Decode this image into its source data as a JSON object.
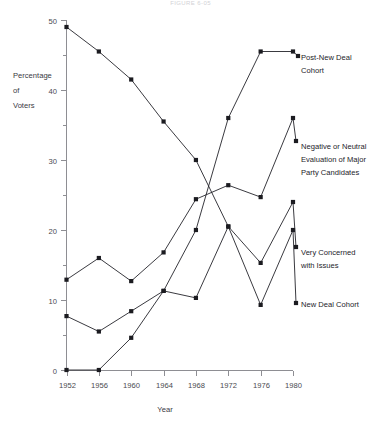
{
  "figure": {
    "title": "FIGURE 6-05",
    "axis_label_y_lines": [
      "Percentage",
      "of",
      "Voters"
    ],
    "axis_label_x": "Year"
  },
  "chart_data": {
    "type": "line",
    "title": "FIGURE 6-05",
    "xlabel": "Year",
    "ylabel": "Percentage of Voters",
    "categories": [
      "1952",
      "1956",
      "1960",
      "1964",
      "1968",
      "1972",
      "1976",
      "1980"
    ],
    "x": [
      1952,
      1956,
      1960,
      1964,
      1968,
      1972,
      1976,
      1980
    ],
    "xlim": [
      1952,
      1980
    ],
    "ylim": [
      0,
      50
    ],
    "yticks": [
      0,
      10,
      20,
      30,
      40,
      50
    ],
    "yminorticks": [
      5,
      15,
      25,
      35,
      45
    ],
    "grid": false,
    "legend_position": "right-inline-labels",
    "marker": "square",
    "series": [
      {
        "name": "New Deal Cohort",
        "label": "New Deal Cohort",
        "values": [
          49.0,
          45.5,
          41.5,
          35.5,
          30.0,
          20.5,
          9.3,
          20.0
        ]
      },
      {
        "name": "Post-New Deal Cohort",
        "label": "Post-New Deal Cohort",
        "values": [
          0.0,
          0.0,
          4.6,
          11.3,
          20.0,
          36.0,
          45.5,
          45.5
        ]
      },
      {
        "name": "Negative or Neutral Evaluation of Major Party Candidates",
        "label": "Negative or Neutral Evaluation of Major Party Candidates",
        "label_lines": [
          "Negative or Neutral",
          "Evaluation of Major",
          "Party Candidates"
        ],
        "values": [
          12.9,
          16.0,
          12.7,
          16.8,
          24.4,
          26.4,
          24.7,
          36.0
        ]
      },
      {
        "name": "Very Concerned with Issues",
        "label": "Very Concerned with Issues",
        "label_lines": [
          "Very Concerned",
          "with Issues"
        ],
        "values": [
          7.7,
          5.5,
          8.4,
          11.3,
          10.3,
          20.5,
          15.3,
          24.0
        ]
      }
    ]
  },
  "legend": [
    {
      "id": "post-new-deal-cohort",
      "lines": [
        "Post-New Deal",
        "Cohort"
      ]
    },
    {
      "id": "negative-neutral-evaluation",
      "lines": [
        "Negative or Neutral",
        "Evaluation of Major",
        "Party Candidates"
      ]
    },
    {
      "id": "very-concerned-with-issues",
      "lines": [
        "Very Concerned",
        "with Issues"
      ]
    },
    {
      "id": "new-deal-cohort",
      "lines": [
        "New Deal Cohort"
      ]
    }
  ]
}
